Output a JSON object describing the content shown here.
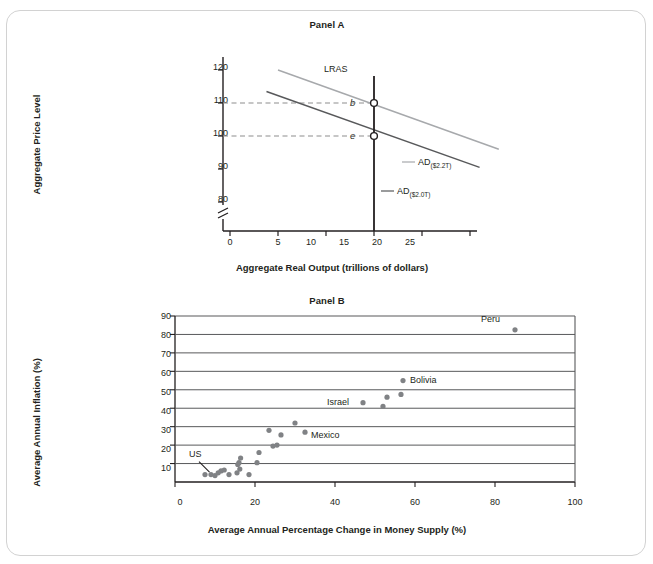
{
  "figure": {
    "frame_color": "#d2d2d2",
    "background": "#ffffff"
  },
  "panelA": {
    "title": "Panel A",
    "ylabel": "Aggregate Price Level",
    "xlabel": "Aggregate Real Output (trillions of dollars)",
    "y_ticks": [
      "80",
      "90",
      "100",
      "110",
      "120"
    ],
    "x_ticks": [
      "0",
      "5",
      "10",
      "15",
      "20",
      "25"
    ],
    "axis_break": true,
    "lras_label": "LRAS",
    "lras_x": 15,
    "equilibrium_points": [
      {
        "label": "b",
        "x": 15,
        "y": 110
      },
      {
        "label": "e",
        "x": 15,
        "y": 100
      }
    ],
    "curves": [
      {
        "name": "AD 2.2T",
        "label_main": "AD",
        "label_sub": "($2.2T)",
        "color": "#a7a9ac",
        "x1": 5,
        "y1": 120,
        "x2": 28,
        "y2": 96
      },
      {
        "name": "AD 2.0T",
        "label_main": "AD",
        "label_sub": "($2.0T)",
        "color": "#58595b",
        "x1": 3.8,
        "y1": 113.5,
        "x2": 26,
        "y2": 90.5
      }
    ],
    "dashed_guides": [
      110,
      100
    ]
  },
  "panelB": {
    "title": "Panel B",
    "ylabel": "Average Annual Inflation (%)",
    "xlabel": "Average Annual Percentage Change in Money Supply (%)",
    "y_ticks": [
      "10",
      "20",
      "30",
      "40",
      "50",
      "60",
      "70",
      "80",
      "90"
    ],
    "x_ticks": [
      "0",
      "20",
      "40",
      "60",
      "80",
      "100"
    ]
  },
  "chart_data": [
    {
      "type": "line",
      "title": "Panel A",
      "xlabel": "Aggregate Real Output (trillions of dollars)",
      "ylabel": "Aggregate Price Level",
      "xlim": [
        0,
        29
      ],
      "ylim": [
        75,
        124
      ],
      "grid": false,
      "legend": "none",
      "series": [
        {
          "name": "LRAS",
          "type": "vertical-line",
          "x": 15,
          "color": "#231f20"
        },
        {
          "name": "AD($2.2T)",
          "type": "line",
          "points": [
            [
              5,
              120
            ],
            [
              28,
              96
            ]
          ],
          "color": "#a7a9ac"
        },
        {
          "name": "AD($2.0T)",
          "type": "line",
          "points": [
            [
              3.8,
              113.5
            ],
            [
              26,
              90.5
            ]
          ],
          "color": "#58595b"
        }
      ],
      "annotations": [
        {
          "label": "b",
          "x": 15,
          "y": 110,
          "marker": "open-circle"
        },
        {
          "label": "e",
          "x": 15,
          "y": 100,
          "marker": "open-circle"
        }
      ]
    },
    {
      "type": "scatter",
      "title": "Panel B",
      "xlabel": "Average Annual Percentage Change in Money Supply (%)",
      "ylabel": "Average Annual Inflation (%)",
      "xlim": [
        0,
        100
      ],
      "ylim": [
        0,
        90
      ],
      "grid": "horizontal",
      "legend": "none",
      "point_color": "#808285",
      "points": [
        {
          "x": 7.5,
          "y": 4
        },
        {
          "x": 9.0,
          "y": 4,
          "label": "US"
        },
        {
          "x": 10.0,
          "y": 3.5
        },
        {
          "x": 10.8,
          "y": 5
        },
        {
          "x": 11.5,
          "y": 6
        },
        {
          "x": 12.3,
          "y": 6.5
        },
        {
          "x": 13.5,
          "y": 4
        },
        {
          "x": 15.5,
          "y": 5
        },
        {
          "x": 15.7,
          "y": 9.5
        },
        {
          "x": 16.0,
          "y": 10.5
        },
        {
          "x": 16.2,
          "y": 7
        },
        {
          "x": 16.4,
          "y": 13
        },
        {
          "x": 18.5,
          "y": 4
        },
        {
          "x": 20.5,
          "y": 10.5
        },
        {
          "x": 21.0,
          "y": 16
        },
        {
          "x": 23.5,
          "y": 28
        },
        {
          "x": 24.5,
          "y": 19.5
        },
        {
          "x": 25.5,
          "y": 20
        },
        {
          "x": 26.5,
          "y": 25.5
        },
        {
          "x": 30.0,
          "y": 32
        },
        {
          "x": 32.5,
          "y": 27,
          "label": "Mexico"
        },
        {
          "x": 47.0,
          "y": 43,
          "label": "Israel"
        },
        {
          "x": 52.0,
          "y": 41
        },
        {
          "x": 53.0,
          "y": 46
        },
        {
          "x": 56.5,
          "y": 47.5
        },
        {
          "x": 57.0,
          "y": 55,
          "label": "Bolivia"
        },
        {
          "x": 85.0,
          "y": 82.5,
          "label": "Peru"
        }
      ]
    }
  ]
}
